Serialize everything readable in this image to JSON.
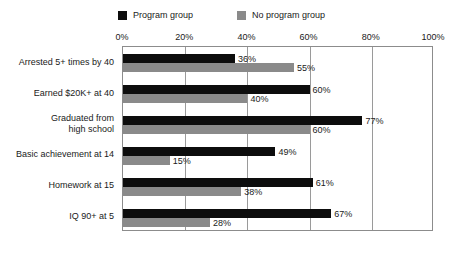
{
  "chart_data": {
    "type": "bar",
    "orientation": "horizontal",
    "title": "",
    "xlabel": "",
    "ylabel": "",
    "xlim": [
      0,
      100
    ],
    "xticks": [
      "0%",
      "20%",
      "40%",
      "60%",
      "80%",
      "100%"
    ],
    "xtick_values": [
      0,
      20,
      40,
      60,
      80,
      100
    ],
    "grid": true,
    "grid_axis": "x",
    "legend_position": "top",
    "value_suffix": "%",
    "categories": [
      "Arrested 5+ times by 40",
      "Earned $20K+ at 40",
      "Graduated from\nhigh school",
      "Basic achievement at 14",
      "Homework at 15",
      "IQ 90+ at 5"
    ],
    "series": [
      {
        "name": "Program group",
        "color": "#0d0d0d",
        "values": [
          36,
          60,
          77,
          49,
          61,
          67
        ],
        "labels": [
          "36%",
          "60%",
          "77%",
          "49%",
          "61%",
          "67%"
        ]
      },
      {
        "name": "No program group",
        "color": "#8a8a8a",
        "values": [
          55,
          40,
          60,
          15,
          38,
          28
        ],
        "labels": [
          "55%",
          "40%",
          "60%",
          "15%",
          "38%",
          "28%"
        ]
      }
    ]
  },
  "colors": {
    "program": "#0d0d0d",
    "no_program": "#8a8a8a",
    "frame": "#8c8c8c",
    "grid": "#9a9a9a",
    "background": "#ffffff",
    "text": "#1a1a1a"
  }
}
